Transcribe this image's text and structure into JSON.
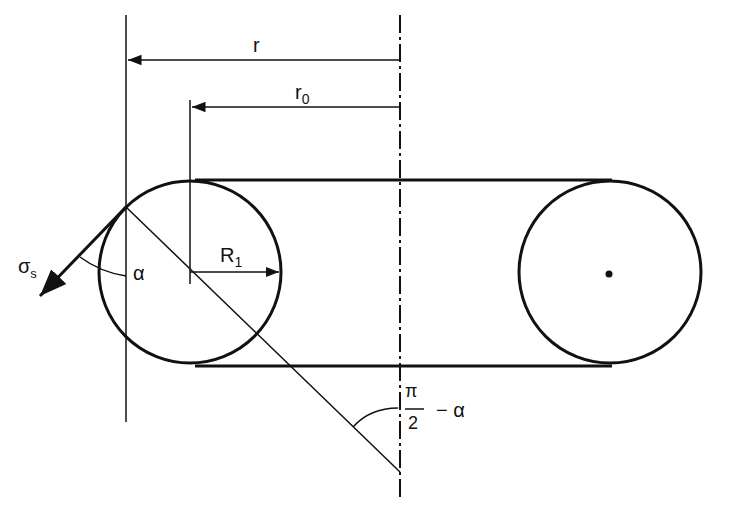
{
  "diagram": {
    "type": "belt-pulley-geometry",
    "colors": {
      "stroke": "#111111",
      "background": "#ffffff"
    },
    "labels": {
      "r": "r",
      "r0_main": "r",
      "r0_sub": "0",
      "R1_main": "R",
      "R1_sub": "1",
      "sigma_main": "σ",
      "sigma_sub": "s",
      "alpha": "α",
      "angle_num": "π",
      "angle_den": "2",
      "angle_rest": "− α"
    },
    "elements": {
      "left_circle": {
        "cx": 190,
        "cy": 272,
        "r": 91
      },
      "right_circle": {
        "cx": 610,
        "cy": 272,
        "r": 91
      },
      "belt_top_y": 180,
      "belt_bottom_y": 366,
      "axis_x": 400,
      "reference_line_x": 126
    }
  }
}
